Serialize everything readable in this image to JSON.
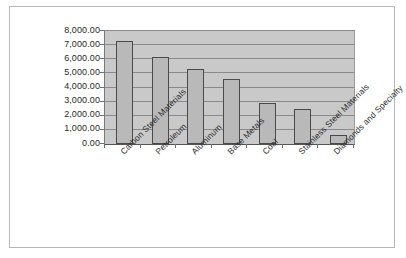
{
  "chart_data": {
    "type": "bar",
    "title": "",
    "xlabel": "",
    "ylabel": "",
    "categories": [
      "Carbon Steel Materials",
      "Petroleum",
      "Aluminum",
      "Base Metals",
      "Coal",
      "Stainless Steel Materials",
      "Diamonds and Specialty"
    ],
    "values": [
      7300,
      6150,
      5300,
      4600,
      2900,
      2450,
      650
    ],
    "ylim": [
      0,
      8000
    ],
    "ytick_values": [
      0,
      1000,
      2000,
      3000,
      4000,
      5000,
      6000,
      7000,
      8000
    ],
    "ytick_labels": [
      "0.00",
      "1,000.00",
      "2,000.00",
      "3,000.00",
      "4,000.00",
      "5,000.00",
      "6,000.00",
      "7,000.00",
      "8,000.00"
    ],
    "grid": true,
    "legend": false,
    "legend_position": "none",
    "colors": {
      "bar_fill": "#b9b9b9",
      "bar_border": "#4a4a4a",
      "plot_background": "#c9c9c9",
      "gridline": "#8a8a8a",
      "frame_border": "#b6b6b6",
      "text": "#2a2a2a"
    }
  }
}
